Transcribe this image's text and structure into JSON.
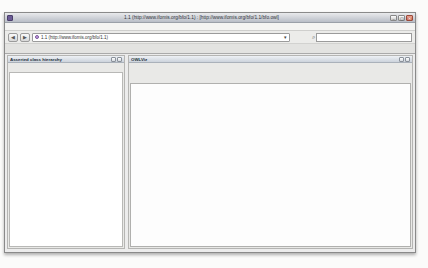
{
  "window": {
    "title": "1.1 (http://www.ifomis.org/bfo/1.1) : [http://www.ifomis.org/bfo/1.1/bfo.owl]",
    "buttons": {
      "minimize": "–",
      "maximize": "▢",
      "close": "✕"
    },
    "menu": [
      "File",
      "Edit",
      "Ontologies",
      "Reasoner",
      "Tools",
      "Refactor",
      "Tabs",
      "View",
      "Window",
      "Help"
    ],
    "toolbar": {
      "back_glyph": "◀",
      "forward_glyph": "▶",
      "ontology_combo_value": "1.1 (http://www.ifomis.org/bfo/1.1)",
      "combo_arrow": "▾",
      "search_glyph": "⌕",
      "search_value": ""
    },
    "tabs": [
      "Active Ontology",
      "Entities",
      "Classes",
      "Object Properties",
      "Data Properties",
      "Individuals",
      "OWLViz",
      "DL Query"
    ],
    "selected_tab": "OWLViz"
  },
  "class_tree_panel": {
    "title": "Asserted class hierarchy",
    "header_buttons": [
      "panel-float-button",
      "panel-close-button"
    ],
    "toolbar": [
      {
        "name": "add-subclass-button",
        "glyph": "⊕"
      },
      {
        "name": "add-sibling-class-button",
        "glyph": "⊜"
      },
      {
        "name": "delete-class-button",
        "glyph": "⊗"
      }
    ]
  },
  "owlviz_panel": {
    "title": "OWLViz",
    "header_buttons": [
      "panel-float-button",
      "panel-close-button"
    ],
    "toolbar": [
      {
        "name": "track-selection-button",
        "glyph": "◉",
        "enabled": true
      },
      {
        "name": "show-superclasses-button",
        "glyph": "∧",
        "enabled": true
      },
      {
        "name": "show-subclasses-button",
        "glyph": "∨",
        "enabled": true
      },
      {
        "name": "show-all-classes-button",
        "glyph": "⊞",
        "enabled": true
      },
      {
        "name": "hide-class-button",
        "glyph": "◌",
        "enabled": true
      },
      {
        "name": "hide-subclasses-button",
        "glyph": "A",
        "enabled": true
      },
      {
        "name": "hide-all-classes-button",
        "glyph": "✕",
        "enabled": true
      },
      {
        "name": "select-mode-button",
        "glyph": "⬚",
        "enabled": true
      },
      {
        "name": "zoom-in-button",
        "glyph": "⊕",
        "enabled": true
      },
      {
        "name": "zoom-out-button",
        "glyph": "⊖",
        "enabled": true
      },
      {
        "name": "reset-view-button",
        "glyph": "⊙",
        "enabled": false
      },
      {
        "name": "export-image-button",
        "glyph": "▭",
        "enabled": false
      }
    ],
    "model_tabs": [
      "Asserted model",
      "Inferred model"
    ],
    "selected_model_tab": "Asserted model"
  },
  "hierarchy": {
    "label": "Thing",
    "children": [
      {
        "label": "Entity",
        "children": [
          {
            "label": "Continuant",
            "children": [
              {
                "label": "DependentContinuant",
                "children": [
                  {
                    "label": "GenericallyDependentContinuant"
                  },
                  {
                    "label": "SpecificallyDependentContinuant"
                  }
                ]
              },
              {
                "label": "IndependentContinuant",
                "children": [
                  {
                    "label": "MaterialEntity"
                  },
                  {
                    "label": "ObjectBoundary"
                  },
                  {
                    "label": "Site"
                  }
                ]
              },
              {
                "label": "SpatialRegion",
                "children": [
                  {
                    "label": "OneDimensionalRegion"
                  },
                  {
                    "label": "ThreeDimensionalRegion"
                  },
                  {
                    "label": "TwoDimensionalRegion"
                  },
                  {
                    "label": "ZeroDimensionalRegion"
                  }
                ]
              }
            ]
          },
          {
            "label": "Occurrent",
            "children": [
              {
                "label": "ProcessualEntity",
                "children": [
                  {
                    "label": "FiatProcessPart"
                  },
                  {
                    "label": "Process"
                  },
                  {
                    "label": "ProcessAggregate"
                  },
                  {
                    "label": "ProcessBoundary"
                  },
                  {
                    "label": "ProcessualContext"
                  }
                ]
              },
              {
                "label": "SpatiotemporalRegion",
                "children": [
                  {
                    "label": "ConnectedSpatiotemporalRegion",
                    "collapsed": true
                  },
                  {
                    "label": "ScatteredSpatiotemporalRegion"
                  }
                ]
              },
              {
                "label": "TemporalRegion",
                "children": [
                  {
                    "label": "ConnectedTemporalRegion",
                    "collapsed": true
                  },
                  {
                    "label": "ScatteredTemporalRegion"
                  }
                ]
              }
            ]
          }
        ]
      }
    ]
  },
  "colors": {
    "class_icon": "#e8a33d",
    "node_border": "#7a7f86",
    "node_fill": "#ffffff",
    "edge": "#a0a4ab",
    "trunk_edge": "#6d7278",
    "header_gradient_bottom": "#ccd3dc",
    "titlebar_gradient_bottom": "#b9bec7",
    "close_button": "#c96a56"
  }
}
